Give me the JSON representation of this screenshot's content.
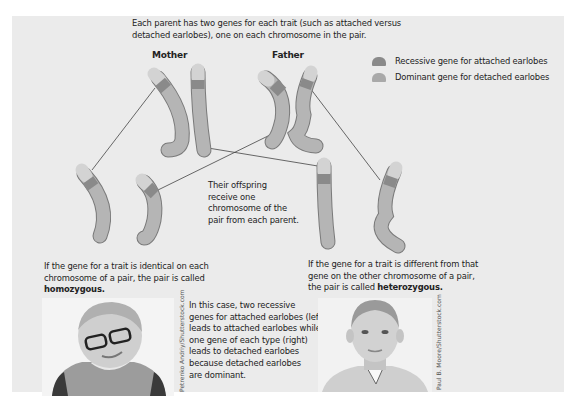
{
  "intro": {
    "line1": "Each parent has two genes for each trait (such as attached versus",
    "line2": "detached earlobes), one on each chromosome in the pair."
  },
  "parents": {
    "mother_label": "Mother",
    "father_label": "Father"
  },
  "legend": {
    "items": [
      {
        "label": "Recessive gene for attached earlobes",
        "color": "#8a8a8a"
      },
      {
        "label": "Dominant gene for detached earlobes",
        "color": "#a9a9a9"
      }
    ]
  },
  "offspring_note": {
    "line1": "Their offspring",
    "line2": "receive one",
    "line3": "chromosome  of the",
    "line4": "pair from each parent."
  },
  "homozygous": {
    "line1": "If the gene for a trait is identical on each",
    "line2": "chromosome of a pair, the pair is called",
    "term": "homozygous."
  },
  "heterozygous": {
    "line1": "If the gene for a trait is different from that",
    "line2": "gene on the other chromosome of a pair,",
    "line3_prefix": "the pair is called ",
    "term": "heterozygous."
  },
  "explanation": {
    "line1": "In this case, two recessive",
    "line2": "genes for attached earlobes (left)",
    "line3": "leads to attached earlobes while",
    "line4": "one gene of each type (right)",
    "line5": "leads to detached earlobes",
    "line6": "because detached earlobes",
    "line7": "are dominant."
  },
  "photos": {
    "left_credit": "Petrenko Andriy/Shutterstock.com",
    "right_credit": "Paul B. Moore/Shutterstock.com"
  },
  "colors": {
    "panel_bg": "#ebebeb",
    "chromosome_body": "#b5b5b5",
    "chromosome_tip": "#d3d3d3",
    "recessive_band": "#8a8a8a",
    "outline": "#7a7a7a"
  }
}
